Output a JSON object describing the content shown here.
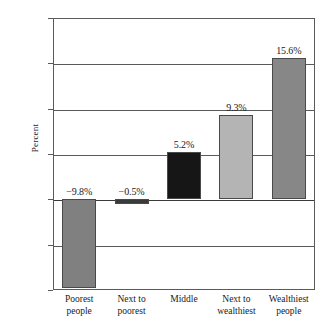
{
  "chart_data": {
    "type": "bar",
    "title": "",
    "xlabel": "",
    "ylabel": "Percent",
    "ylim": [
      -10,
      20
    ],
    "yticks": [
      20,
      15,
      10,
      5,
      0,
      -5,
      -10
    ],
    "ytick_labels": [
      "20",
      "15",
      "10",
      "5",
      "0",
      "−5",
      "−10"
    ],
    "grid": true,
    "legend": null,
    "categories": [
      "Poorest people",
      "Next to poorest",
      "Middle",
      "Next to wealthiest",
      "Wealthiest people"
    ],
    "category_lines": [
      [
        "Poorest",
        "people"
      ],
      [
        "Next to",
        "poorest"
      ],
      [
        "Middle",
        ""
      ],
      [
        "Next to",
        "wealthiest"
      ],
      [
        "Wealthiest",
        "people"
      ]
    ],
    "values": [
      -9.8,
      -0.5,
      5.2,
      9.3,
      15.6
    ],
    "data_labels": [
      "−9.8%",
      "−0.5%",
      "5.2%",
      "9.3%",
      "15.6%"
    ],
    "bar_colors": [
      "#808080",
      "#3a3a3a",
      "#161616",
      "#b4b4b4",
      "#878787"
    ],
    "bar_edge_color": "#4a4a4a",
    "axis_color": "#5a5a5a",
    "background": "#ffffff"
  }
}
